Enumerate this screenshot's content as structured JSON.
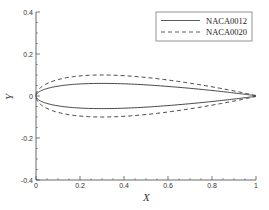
{
  "chart_data": {
    "type": "line",
    "title": "",
    "xlabel": "X",
    "ylabel": "Y",
    "xlim": [
      0,
      1
    ],
    "ylim": [
      -0.4,
      0.4
    ],
    "x_ticks": [
      "0",
      "0.2",
      "0.4",
      "0.6",
      "0.8",
      "1"
    ],
    "y_ticks": [
      "-0.4",
      "-0.2",
      "0",
      "0.2",
      "0.4"
    ],
    "grid": false,
    "legend_position": "upper right",
    "series": [
      {
        "name": "NACA0012",
        "style": "solid",
        "max_thickness": 0.12,
        "x": [
          0,
          0.0125,
          0.025,
          0.05,
          0.1,
          0.15,
          0.2,
          0.3,
          0.4,
          0.5,
          0.6,
          0.7,
          0.8,
          0.9,
          0.95,
          1.0
        ],
        "y_upper": [
          0,
          0.0189,
          0.0262,
          0.0355,
          0.0468,
          0.0534,
          0.0574,
          0.06,
          0.058,
          0.0529,
          0.0456,
          0.0366,
          0.0262,
          0.0145,
          0.0081,
          0.0013
        ],
        "y_lower": [
          0,
          -0.0189,
          -0.0262,
          -0.0355,
          -0.0468,
          -0.0534,
          -0.0574,
          -0.06,
          -0.058,
          -0.0529,
          -0.0456,
          -0.0366,
          -0.0262,
          -0.0145,
          -0.0081,
          -0.0013
        ]
      },
      {
        "name": "NACA0020",
        "style": "dashed",
        "max_thickness": 0.2,
        "x": [
          0,
          0.0125,
          0.025,
          0.05,
          0.1,
          0.15,
          0.2,
          0.3,
          0.4,
          0.5,
          0.6,
          0.7,
          0.8,
          0.9,
          0.95,
          1.0
        ],
        "y_upper": [
          0,
          0.0316,
          0.0437,
          0.0592,
          0.0781,
          0.0891,
          0.0956,
          0.1001,
          0.0967,
          0.0882,
          0.0761,
          0.0611,
          0.0437,
          0.0241,
          0.0135,
          0.0021
        ],
        "y_lower": [
          0,
          -0.0316,
          -0.0437,
          -0.0592,
          -0.0781,
          -0.0891,
          -0.0956,
          -0.1001,
          -0.0967,
          -0.0882,
          -0.0761,
          -0.0611,
          -0.0437,
          -0.0241,
          -0.0135,
          -0.0021
        ]
      }
    ]
  },
  "legend": {
    "items": [
      {
        "label": "NACA0012",
        "style": "solid"
      },
      {
        "label": "NACA0020",
        "style": "dashed"
      }
    ]
  },
  "axes": {
    "xlabel": "X",
    "ylabel": "Y",
    "x_ticks": [
      "0",
      "0.2",
      "0.4",
      "0.6",
      "0.8",
      "1"
    ],
    "y_ticks": [
      "-0.4",
      "-0.2",
      "0",
      "0.2",
      "0.4"
    ]
  },
  "colors": {
    "line": "#333333",
    "axis": "#444444"
  }
}
